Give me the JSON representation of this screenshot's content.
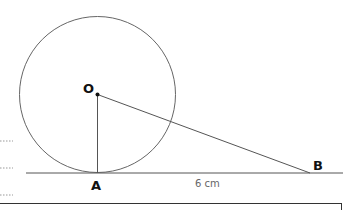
{
  "diagram": {
    "type": "geometry",
    "labels": {
      "center": "O",
      "tangent_point": "A",
      "external_point": "B",
      "measure_AB": "6 cm"
    },
    "circle": {
      "cx": 97.5,
      "cy": 94.5,
      "r": 78
    },
    "points": {
      "O": [
        97.5,
        94.5
      ],
      "A": [
        97.5,
        173
      ],
      "B": [
        310,
        173
      ]
    },
    "tangent_line": {
      "x1": 26,
      "y1": 173,
      "x2": 343,
      "y2": 173
    },
    "colors": {
      "stroke": "#555555",
      "label": "#111111",
      "measure": "#666666"
    },
    "answer_lines": [
      "..........",
      "..........",
      ".........."
    ]
  }
}
